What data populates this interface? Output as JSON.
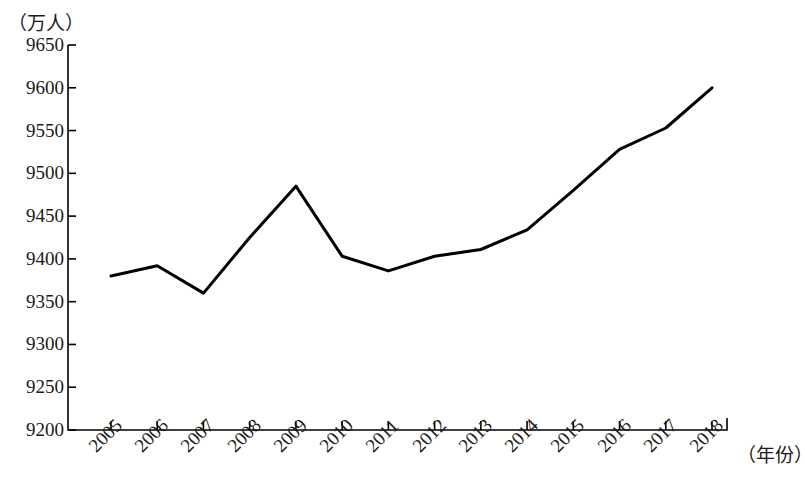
{
  "chart_data": {
    "type": "line",
    "title": "",
    "subtitle": "",
    "xlabel": "（年份）",
    "ylabel": "（万人）",
    "categories": [
      "2005",
      "2006",
      "2007",
      "2008",
      "2009",
      "2010",
      "2011",
      "2012",
      "2013",
      "2014",
      "2015",
      "2016",
      "2017",
      "2018"
    ],
    "values": [
      9380,
      9392,
      9360,
      9425,
      9485,
      9403,
      9386,
      9403,
      9411,
      9434,
      9480,
      9528,
      9553,
      9600
    ],
    "series": [
      {
        "name": "人口",
        "values": [
          9380,
          9392,
          9360,
          9425,
          9485,
          9403,
          9386,
          9403,
          9411,
          9434,
          9480,
          9528,
          9553,
          9600
        ]
      }
    ],
    "ylim": [
      9200,
      9650
    ],
    "yticks": [
      9200,
      9250,
      9300,
      9350,
      9400,
      9450,
      9500,
      9550,
      9600,
      9650
    ],
    "ytick_labels": [
      "9200",
      "9250",
      "9300",
      "9350",
      "9400",
      "9450",
      "9500",
      "9550",
      "9600",
      "9650"
    ],
    "xtick_labels": [
      "2005",
      "2006",
      "2007",
      "2008",
      "2009",
      "2010",
      "2011",
      "2012",
      "2013",
      "2014",
      "2015",
      "2016",
      "2017",
      "2018"
    ],
    "grid": false,
    "legend": false,
    "legend_position": "none",
    "line_color": "#000000",
    "axis_color": "#000000",
    "background_color": "#ffffff",
    "markers": false,
    "annotations": []
  },
  "axis": {
    "y_unit_label": "（万人）",
    "x_unit_label": "（年份）"
  }
}
